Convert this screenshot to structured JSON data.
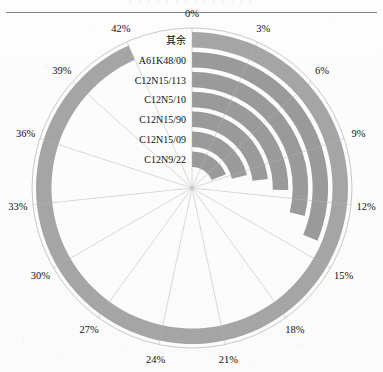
{
  "header": {
    "cut_off_text": "· · ·  · · · · · ·  · · · · ·"
  },
  "chart_data": {
    "type": "bar",
    "subtype": "polar-nested-radial-bar",
    "title": "",
    "xlabel": "",
    "ylabel": "",
    "categories": [
      "其余",
      "A61K48/00",
      "C12N15/113",
      "C12N5/10",
      "C12N15/90",
      "C12N15/09",
      "C12N9/22"
    ],
    "values": [
      42.0,
      14.1,
      13.0,
      11.4,
      10.4,
      9.6,
      8.5
    ],
    "tick_labels": [
      "0%",
      "3%",
      "6%",
      "9%",
      "12%",
      "15%",
      "18%",
      "21%",
      "24%",
      "27%",
      "30%",
      "33%",
      "36%",
      "39%",
      "42%"
    ],
    "tick_values": [
      0,
      3,
      6,
      9,
      12,
      15,
      18,
      21,
      24,
      27,
      30,
      33,
      36,
      39,
      42
    ],
    "angular_axis_max": 45,
    "grid": true,
    "legend": "none",
    "series": [
      {
        "name": "其余",
        "value": 42.0,
        "ring": 0
      },
      {
        "name": "A61K48/00",
        "value": 14.1,
        "ring": 1
      },
      {
        "name": "C12N15/113",
        "value": 13.0,
        "ring": 2
      },
      {
        "name": "C12N5/10",
        "value": 11.4,
        "ring": 3
      },
      {
        "name": "C12N15/90",
        "value": 10.4,
        "ring": 4
      },
      {
        "name": "C12N15/09",
        "value": 9.6,
        "ring": 5
      },
      {
        "name": "C12N9/22",
        "value": 8.5,
        "ring": 6
      }
    ],
    "colors": {
      "bar": "#9a9a9a",
      "bar_outer": "#a5a5a5",
      "grid": "#b8b8b8",
      "outline": "#c2c2c2",
      "background": "#ffffff",
      "text": "#111111"
    }
  }
}
